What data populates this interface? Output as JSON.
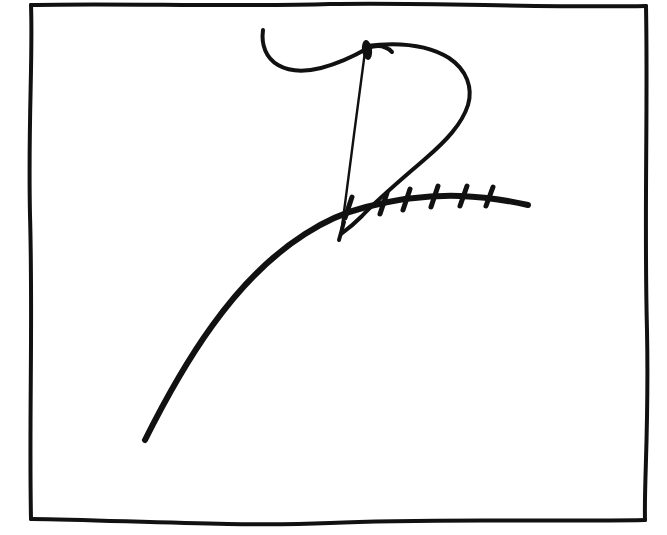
{
  "document": {
    "kind": "hand-drawn-ink-sketch",
    "medium_description": "black ink pen drawing on white paper",
    "canvas": {
      "width": 667,
      "height": 535
    },
    "background_color": "#ffffff",
    "ink_color": "#111111"
  },
  "frame": {
    "name": "hand-drawn rectangular border",
    "stroke_color": "#111111",
    "stroke_width": 4,
    "corners": {
      "top_left": [
        31,
        5
      ],
      "top_right": [
        646,
        6
      ],
      "bottom_right": [
        645,
        520
      ],
      "bottom_left": [
        31,
        519
      ]
    }
  },
  "figures": {
    "arc": {
      "name": "long sweeping arc",
      "stroke_width": 6,
      "description": "thick curve rising from lower-left to a shallow plateau on the right",
      "start_point": [
        145,
        440
      ],
      "end_point": [
        528,
        205
      ],
      "apex_region": [
        420,
        197
      ],
      "path": "M145,440 C163,404 186,362 212,326 C240,287 272,255 305,234 C325,221 346,212 366,207 C398,199 430,195 460,196 C488,197 510,201 528,205"
    },
    "ticks": {
      "name": "hatch tick marks across the arc",
      "count": 6,
      "stroke_width": 5,
      "description": "six short strokes crossing the arc on its right-hand portion",
      "marks": [
        {
          "index": 1,
          "x1": 345,
          "y1": 218,
          "x2": 352,
          "y2": 197
        },
        {
          "index": 2,
          "x1": 380,
          "y1": 214,
          "x2": 387,
          "y2": 193
        },
        {
          "index": 3,
          "x1": 403,
          "y1": 210,
          "x2": 410,
          "y2": 189
        },
        {
          "index": 4,
          "x1": 431,
          "y1": 207,
          "x2": 438,
          "y2": 186
        },
        {
          "index": 5,
          "x1": 460,
          "y1": 206,
          "x2": 467,
          "y2": 186
        },
        {
          "index": 6,
          "x1": 486,
          "y1": 206,
          "x2": 493,
          "y2": 187
        }
      ]
    },
    "pennant": {
      "name": "cursive P-shaped flag figure",
      "description": "an upper hook sweeping in from the left, a long thin vertical stem descending to the arc, and a large teardrop loop to the right",
      "hook": {
        "name": "upper-left hook stroke",
        "stroke_width": 4,
        "start_point": [
          263,
          30
        ],
        "end_point": [
          392,
          52
        ],
        "path": "M263,30 C261,45 266,58 278,65 C290,72 305,72 321,68 C340,63 356,55 368,48 C378,44 386,46 392,52"
      },
      "stem": {
        "name": "thin vertical stem stroke",
        "stroke_width": 2,
        "top_point": [
          366,
          43
        ],
        "bottom_point": [
          341,
          233
        ],
        "path": "M366,44 C362,76 356,118 351,158 C347,188 344,213 341,233"
      },
      "stem_blob": {
        "name": "ink blob at stem top",
        "cx": 367,
        "cy": 50,
        "rx": 5,
        "ry": 10,
        "rotation": -8
      },
      "loop": {
        "name": "teardrop loop stroke",
        "stroke_width": 4,
        "description": "rises right from stem top, bulges far right, then tapers back down to the stem foot",
        "path": "M366,46 C398,42 428,45 449,58 C467,70 473,88 468,105 C462,124 446,141 425,159 C402,179 378,199 362,216 C352,226 345,231 341,234"
      }
    }
  },
  "annotations": {
    "has_text": false,
    "visible_text": []
  }
}
